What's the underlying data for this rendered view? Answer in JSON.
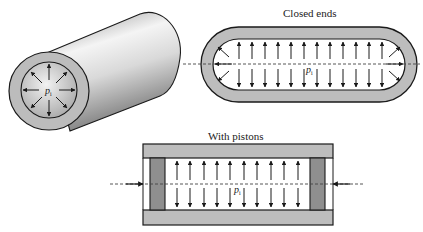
{
  "figure": {
    "cylinder": {
      "pressure_label": "p",
      "pressure_subscript": "i"
    },
    "closed_ends": {
      "title": "Closed ends",
      "pressure_label": "p",
      "pressure_subscript": "i",
      "vertical_arrow_count": 12
    },
    "with_pistons": {
      "title": "With pistons",
      "pressure_label": "p",
      "pressure_subscript": "i",
      "vertical_arrow_count": 10
    }
  },
  "colors": {
    "wall": "#bdbdbd",
    "piston": "#8f8f8f",
    "outline": "#1a1a1a",
    "dash": "#444444"
  }
}
